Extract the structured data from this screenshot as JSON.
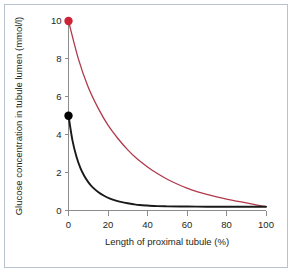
{
  "chart_data": {
    "type": "line",
    "title": "",
    "xlabel": "Length of proximal tubule (%)",
    "ylabel": "Glucose concentration in tubule lumen (mmol/l)",
    "xlim": [
      0,
      100
    ],
    "ylim": [
      0,
      10
    ],
    "xticks": [
      0,
      20,
      40,
      60,
      80,
      100
    ],
    "yticks": [
      0,
      2,
      4,
      6,
      8,
      10
    ],
    "xtick_labels": [
      "0",
      "20",
      "40",
      "60",
      "80",
      "100"
    ],
    "ytick_labels": [
      "0",
      "2",
      "4",
      "6",
      "8",
      "10"
    ],
    "grid": false,
    "legend": "none",
    "series": [
      {
        "name": "High plasma glucose (hyperglycaemia)",
        "color": "#b0394b",
        "start_point": {
          "x": 0,
          "y": 10
        },
        "marker": {
          "shape": "circle",
          "x": 0,
          "y": 10,
          "color": "#cc2233"
        },
        "x": [
          0,
          5,
          10,
          15,
          20,
          25,
          30,
          35,
          40,
          45,
          50,
          55,
          60,
          65,
          70,
          75,
          80,
          85,
          90,
          95,
          100
        ],
        "values": [
          10.0,
          8.0,
          6.5,
          5.4,
          4.5,
          3.8,
          3.2,
          2.7,
          2.3,
          1.95,
          1.65,
          1.4,
          1.18,
          1.0,
          0.85,
          0.72,
          0.6,
          0.5,
          0.4,
          0.3,
          0.2
        ]
      },
      {
        "name": "Normal plasma glucose",
        "color": "#1a1a1a",
        "start_point": {
          "x": 0,
          "y": 5
        },
        "marker": {
          "shape": "circle",
          "x": 0,
          "y": 5,
          "color": "#000000"
        },
        "x": [
          0,
          2,
          4,
          6,
          8,
          10,
          12,
          15,
          18,
          21,
          24,
          27,
          30,
          33,
          36,
          40,
          45,
          50,
          60,
          70,
          80,
          90,
          100
        ],
        "values": [
          5.0,
          3.7,
          2.85,
          2.25,
          1.82,
          1.5,
          1.25,
          0.98,
          0.78,
          0.63,
          0.52,
          0.44,
          0.38,
          0.33,
          0.29,
          0.26,
          0.23,
          0.22,
          0.21,
          0.2,
          0.2,
          0.2,
          0.2
        ]
      }
    ]
  },
  "figure": {
    "frame_color": "#b9c3d0",
    "background": "#ffffff",
    "axis_color": "#8c8c8c"
  }
}
